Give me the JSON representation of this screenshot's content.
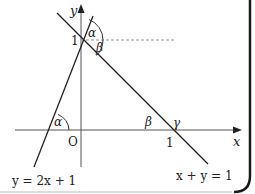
{
  "diagram": {
    "axes": {
      "x_label": "x",
      "y_label": "y",
      "origin_label": "O",
      "y_tick_label": "1",
      "x_tick_label": "1"
    },
    "lines": [
      {
        "equation": "y = 2x + 1",
        "label": "y = 2x + 1"
      },
      {
        "equation": "x + y = 1",
        "label": "x + y = 1"
      }
    ],
    "angles": {
      "alpha_top": "α",
      "beta_top": "β",
      "alpha_bottom": "α",
      "beta_bottom": "β",
      "gamma": "γ"
    },
    "colors": {
      "line": "#222222",
      "axis": "#555555",
      "dashed": "#999999",
      "border": "#1a1a1a"
    }
  }
}
